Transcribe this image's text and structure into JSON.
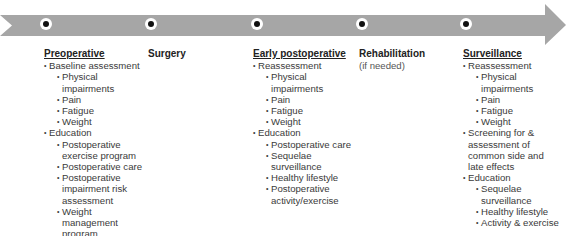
{
  "arrow": {
    "color": "#a6a6a6"
  },
  "phases": [
    {
      "title": "Preoperative",
      "underlined": true,
      "items": [
        {
          "label": "Baseline assessment",
          "children": [
            "Physical impairments",
            "Pain",
            "Fatigue",
            "Weight"
          ]
        },
        {
          "label": "Education",
          "children": [
            "Postoperative exercise program",
            "Postoperative care",
            "Postoperative impairment risk assessment",
            "Weight management program"
          ]
        }
      ]
    },
    {
      "title": "Surgery",
      "underlined": false,
      "items": []
    },
    {
      "title": "Early postoperative",
      "underlined": true,
      "items": [
        {
          "label": "Reassessment",
          "children": [
            "Physical impairments",
            "Pain",
            "Fatigue",
            "Weight"
          ]
        },
        {
          "label": "Education",
          "children": [
            "Postoperative care",
            "Sequelae surveillance",
            "Healthy lifestyle",
            "Postoperative activity/exercise"
          ]
        }
      ]
    },
    {
      "title": "Rehabilitation",
      "subtitle": "(if needed)",
      "underlined": false,
      "items": []
    },
    {
      "title": "Surveillance",
      "underlined": true,
      "items": [
        {
          "label": "Reassessment",
          "children": [
            "Physical impairments",
            "Pain",
            "Fatigue",
            "Weight"
          ]
        },
        {
          "label": "Screening for & assessment of common side and late effects",
          "children": []
        },
        {
          "label": "Education",
          "children": [
            "Sequelae surveillance",
            "Healthy lifestyle",
            "Activity & exercise"
          ]
        }
      ]
    }
  ]
}
